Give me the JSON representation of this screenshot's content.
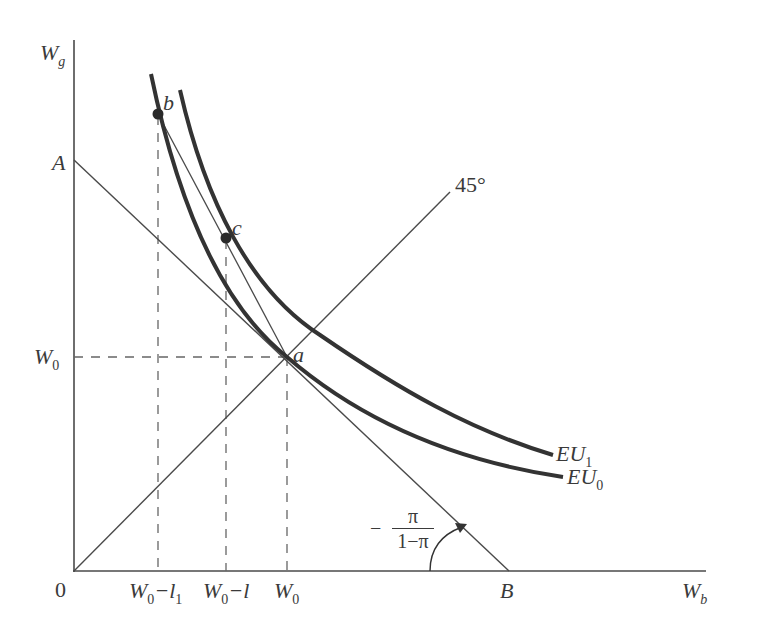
{
  "diagram": {
    "axes": {
      "y_label": "W",
      "y_label_sub": "g",
      "x_label": "W",
      "x_label_sub": "b",
      "origin_label": "0"
    },
    "y_ticks": {
      "A": "A",
      "W0": "W",
      "W0_sub": "0"
    },
    "x_ticks": {
      "t1": "W",
      "t1_sub": "0",
      "t1_rest": "−l",
      "t1_rest_sub": "1",
      "t2": "W",
      "t2_sub": "0",
      "t2_rest": "−l",
      "t3": "W",
      "t3_sub": "0",
      "B": "B"
    },
    "points": {
      "a": "a",
      "b": "b",
      "c": "c"
    },
    "curves": {
      "eu1": "EU",
      "eu1_sub": "1",
      "eu0": "EU",
      "eu0_sub": "0"
    },
    "line_45": "45°",
    "slope": {
      "sign": "−",
      "numerator": "π",
      "denominator": "1−π"
    },
    "colors": {
      "line": "#4a4a4a",
      "curve": "#333333",
      "dashed": "#666666"
    }
  }
}
